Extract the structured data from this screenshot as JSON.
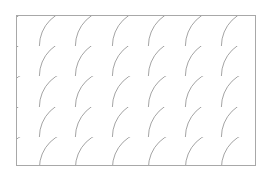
{
  "pattern": {
    "name": "fish-scale",
    "frame": {
      "x": 16,
      "y": 15,
      "width": 240,
      "height": 151
    },
    "radius": 36.6,
    "row_ys": [
      168,
      137,
      107,
      76,
      46
    ],
    "col_xs": [
      2,
      39,
      76,
      112,
      149,
      185,
      222,
      258,
      295
    ],
    "colors": {
      "background": "#ffffff",
      "line": "#9a9a9a",
      "border": "#a8a8a8",
      "fill": "#ffffff"
    }
  }
}
